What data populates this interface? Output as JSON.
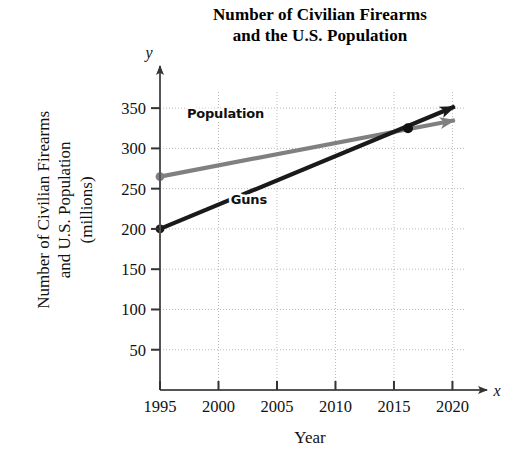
{
  "chart_data": {
    "type": "line",
    "title": "Number of Civilian Firearms and the U.S. Population",
    "title_line1": "Number of Civilian Firearms",
    "title_line2": "and the U.S. Population",
    "xlabel": "Year",
    "ylabel": "Number of Civilian Firearms and U.S. Population (millions)",
    "ylabel_line1": "Number of Civilian Firearms",
    "ylabel_line2": "and U.S. Population",
    "ylabel_line3": "(millions)",
    "x_axis_name": "x",
    "y_axis_name": "y",
    "xlim": [
      1995,
      2021.5
    ],
    "ylim": [
      0,
      375
    ],
    "xticks": [
      1995,
      2000,
      2005,
      2010,
      2015,
      2020
    ],
    "xtick_labels": [
      "1995",
      "2000",
      "2005",
      "2010",
      "2015",
      "2020"
    ],
    "yticks": [
      50,
      100,
      150,
      200,
      250,
      300,
      350
    ],
    "ytick_labels": [
      "50",
      "100",
      "150",
      "200",
      "250",
      "300",
      "350"
    ],
    "grid": true,
    "grid_style": "dotted",
    "legend_position": "inline-annotation",
    "series": [
      {
        "name": "Population",
        "label": "Population",
        "color": "#808080",
        "x": [
          1995,
          2020.2
        ],
        "values": [
          265,
          335
        ],
        "start_marker": true,
        "arrow_end": true,
        "label_x": 2000.6,
        "label_y": 338
      },
      {
        "name": "Guns",
        "label": "Guns",
        "color": "#1a1a1a",
        "x": [
          1995,
          2020.2
        ],
        "values": [
          200,
          352
        ],
        "start_marker": true,
        "arrow_end": true,
        "label_x": 2002.6,
        "label_y": 231
      }
    ],
    "annotations": [
      {
        "name": "intersection-point",
        "x": 2016.2,
        "y": 325,
        "marker": "dot"
      }
    ]
  }
}
